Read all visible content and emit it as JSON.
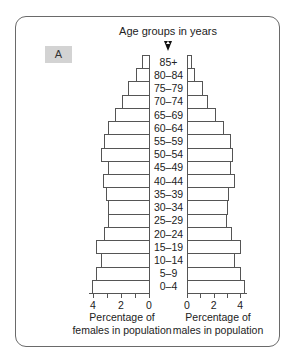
{
  "figure": {
    "panel_label": "A",
    "title": "Age groups in years",
    "left_axis_title_line1": "Percentage of",
    "left_axis_title_line2": "females in population",
    "right_axis_title_line1": "Percentage of",
    "right_axis_title_line2": "males in population"
  },
  "chart_data": {
    "type": "bar",
    "subtype": "population-pyramid",
    "title": "Age groups in years",
    "panel": "A",
    "categories": [
      "85+",
      "80–84",
      "75–79",
      "70–74",
      "65–69",
      "60–64",
      "55–59",
      "50–54",
      "45–49",
      "40–44",
      "35–39",
      "30–34",
      "25–29",
      "20–24",
      "15–19",
      "10–14",
      "5–9",
      "0–4"
    ],
    "series": [
      {
        "name": "Percentage of females in population",
        "side": "left",
        "values": [
          0.5,
          0.9,
          1.5,
          1.9,
          2.4,
          2.9,
          3.2,
          3.4,
          2.9,
          3.3,
          3.1,
          2.9,
          2.9,
          3.2,
          3.8,
          3.4,
          3.8,
          4.1
        ]
      },
      {
        "name": "Percentage of males in population",
        "side": "right",
        "values": [
          0.3,
          0.5,
          1.1,
          1.5,
          2.1,
          2.7,
          3.2,
          3.4,
          3.2,
          3.5,
          3.1,
          3.0,
          2.9,
          3.3,
          4.0,
          3.5,
          4.0,
          4.3
        ]
      }
    ],
    "xlabel_left": "Percentage of females in population",
    "xlabel_right": "Percentage of males in population",
    "ylabel": "Age groups in years",
    "xlim": [
      0,
      4.5
    ],
    "tick_labels": [
      "4",
      "2",
      "0",
      "0",
      "2",
      "4"
    ],
    "major_ticks": [
      0,
      2,
      4
    ],
    "minor_ticks": [
      1,
      3
    ],
    "grid": false,
    "legend": "none"
  }
}
